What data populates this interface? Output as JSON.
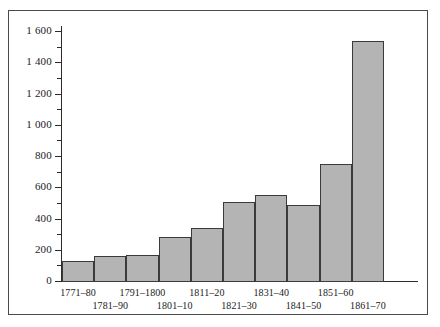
{
  "chart_data": {
    "type": "bar",
    "title": "",
    "subtitle": "",
    "xlabel": "",
    "ylabel": "",
    "categories": [
      "1771–80",
      "1781–90",
      "1791–1800",
      "1801–10",
      "1811–20",
      "1821–30",
      "1831–40",
      "1841–50",
      "1851–60",
      "1861–70"
    ],
    "values": [
      135,
      165,
      170,
      290,
      345,
      515,
      560,
      490,
      755,
      1540
    ],
    "ylim": [
      0,
      1600
    ],
    "y_major_ticks": [
      0,
      200,
      400,
      600,
      800,
      1000,
      1200,
      1400,
      1600
    ],
    "y_minor_ticks": [
      100,
      300,
      500,
      700,
      900,
      1100,
      1300,
      1500
    ],
    "y_tick_labels": [
      "0",
      "200",
      "400",
      "600",
      "800",
      "1 000",
      "1 200",
      "1 400",
      "1 600"
    ],
    "grid": false,
    "legend": [],
    "legend_position": "none",
    "bar_fill_color": "#b4b4b4",
    "bar_edge_color": "#3a3a3a",
    "axis_color": "#2b2b2b",
    "frame_color": "#4a4a4a",
    "background_color": "#ffffff",
    "x_label_rows": [
      0,
      1,
      0,
      1,
      0,
      1,
      0,
      1,
      0,
      1
    ]
  }
}
